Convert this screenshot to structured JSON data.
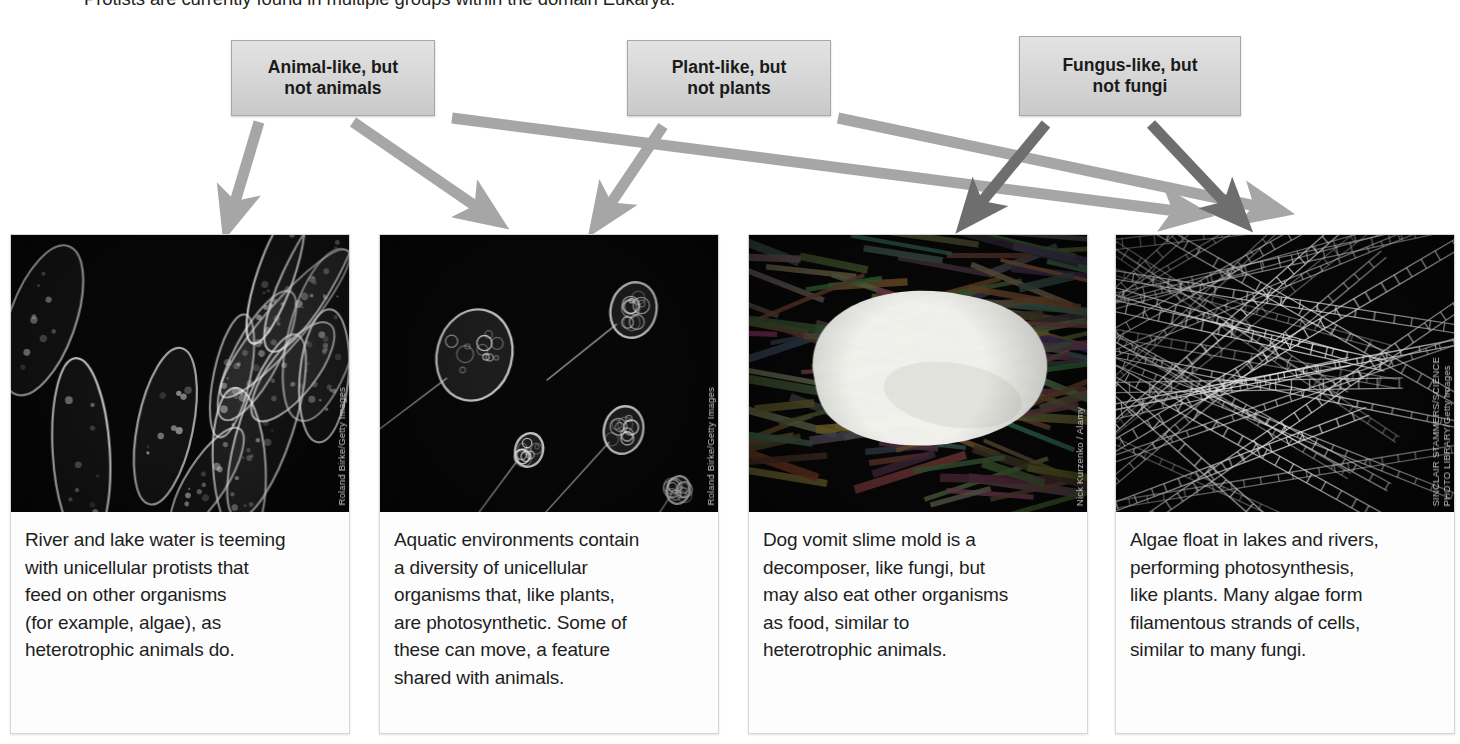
{
  "intro": {
    "text": "Protists are currently found in multiple groups within the domain Eukarya."
  },
  "colors": {
    "arrow_light": "#a6a6a6",
    "arrow_dark": "#6e6e6e",
    "box_fill": "#d8d8d8",
    "box_border": "#a8a8a8",
    "text": "#1e1e1e",
    "photo_bg": "#090909"
  },
  "categories": [
    {
      "id": "animal-like",
      "label": "Animal-like, but\nnot animals",
      "line1": "Animal-like, but",
      "line2": "not animals",
      "arrow_color": "#a6a6a6",
      "targets": [
        0,
        1,
        2
      ]
    },
    {
      "id": "plant-like",
      "label": "Plant-like, but\nnot plants",
      "line1": "Plant-like, but",
      "line2": "not plants",
      "arrow_color": "#a6a6a6",
      "targets": [
        1,
        3
      ]
    },
    {
      "id": "fungus-like",
      "label": "Fungus-like, but\nnot fungi",
      "line1": "Fungus-like, but",
      "line2": "not fungi",
      "arrow_color": "#6e6e6e",
      "targets": [
        2,
        3
      ]
    }
  ],
  "panels": [
    {
      "id": "protists-river-lake",
      "caption": "River and lake water is teeming\nwith unicellular protists that\nfeed on other organisms\n(for example, algae), as\nheterotrophic animals do.",
      "credit": "Roland Birke/Getty Images",
      "photo_alt": "unicellular protists"
    },
    {
      "id": "photosynthetic-flagellates",
      "caption": "Aquatic environments contain\na diversity of unicellular\norganisms that, like plants,\nare photosynthetic. Some of\nthese can move, a feature\nshared with animals.",
      "credit": "Roland Birke/Getty Images",
      "photo_alt": "flagellated photosynthetic cells"
    },
    {
      "id": "dog-vomit-slime-mold",
      "caption": "Dog vomit slime mold is a\ndecomposer, like fungi, but\nmay also eat other organisms\nas food, similar to\nheterotrophic animals.",
      "credit": "Nick Kurzenko / Alamy",
      "photo_alt": "slime mold on bark"
    },
    {
      "id": "filamentous-algae",
      "caption": "Algae float in lakes and rivers,\nperforming photosynthesis,\nlike plants. Many algae form\nfilamentous strands of cells,\nsimilar to many fungi.",
      "credit": "SINCLAIR STAMMERS/SCIENCE\nPHOTO LIBRARY/Getty Images",
      "photo_alt": "filamentous algae strands"
    }
  ],
  "arrows": [
    {
      "from": "animal-like",
      "to": "protists-river-lake",
      "color": "#a6a6a6"
    },
    {
      "from": "animal-like",
      "to": "photosynthetic-flagellates",
      "color": "#a6a6a6"
    },
    {
      "from": "animal-like",
      "to": "dog-vomit-slime-mold",
      "color": "#a6a6a6"
    },
    {
      "from": "plant-like",
      "to": "photosynthetic-flagellates",
      "color": "#a6a6a6"
    },
    {
      "from": "plant-like",
      "to": "filamentous-algae",
      "color": "#a6a6a6"
    },
    {
      "from": "fungus-like",
      "to": "dog-vomit-slime-mold",
      "color": "#6e6e6e"
    },
    {
      "from": "fungus-like",
      "to": "filamentous-algae",
      "color": "#6e6e6e"
    }
  ]
}
